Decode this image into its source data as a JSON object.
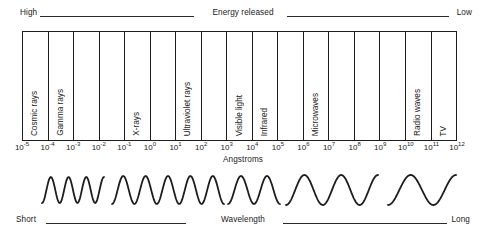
{
  "figure": {
    "unit_label": "Angstroms"
  },
  "energy_axis": {
    "caption": "Energy released",
    "left_label": "High",
    "right_label": "Low"
  },
  "wavelength_axis": {
    "caption": "Wavelength",
    "left_label": "Short",
    "right_label": "Long"
  },
  "chart_data": {
    "type": "table",
    "xlabel": "Angstroms",
    "ylabel": "",
    "grid": false,
    "legend": "none",
    "x_scale": "log10",
    "xlim": [
      -5,
      12
    ],
    "tick_labels": [
      "10-5",
      "10-4",
      "10-3",
      "10-2",
      "10-1",
      "100",
      "101",
      "102",
      "103",
      "104",
      "105",
      "106",
      "107",
      "108",
      "109",
      "1010",
      "1011",
      "1012"
    ],
    "tick_mantissa": "10",
    "tick_exponents": [
      "-5",
      "-4",
      "-3",
      "-2",
      "-1",
      "0",
      "1",
      "2",
      "3",
      "4",
      "5",
      "6",
      "7",
      "8",
      "9",
      "10",
      "11",
      "12"
    ],
    "cells": [
      {
        "label": "Cosmic rays",
        "from": "10-5",
        "to": "10-4"
      },
      {
        "label": "Gamma rays",
        "from": "10-4",
        "to": "10-3"
      },
      {
        "label": "",
        "from": "10-3",
        "to": "10-2"
      },
      {
        "label": "",
        "from": "10-2",
        "to": "10-1"
      },
      {
        "label": "X-rays",
        "from": "10-1",
        "to": "100"
      },
      {
        "label": "",
        "from": "100",
        "to": "101"
      },
      {
        "label": "Ultraviolet rays",
        "from": "101",
        "to": "102"
      },
      {
        "label": "",
        "from": "102",
        "to": "103"
      },
      {
        "label": "Visible light",
        "from": "103",
        "to": "104"
      },
      {
        "label": "Infrared",
        "from": "104",
        "to": "105"
      },
      {
        "label": "",
        "from": "105",
        "to": "106"
      },
      {
        "label": "Microwaves",
        "from": "106",
        "to": "107"
      },
      {
        "label": "",
        "from": "107",
        "to": "108"
      },
      {
        "label": "",
        "from": "108",
        "to": "109"
      },
      {
        "label": "",
        "from": "109",
        "to": "1010"
      },
      {
        "label": "Radio waves",
        "from": "1010",
        "to": "1011"
      },
      {
        "label": "TV",
        "from": "1011",
        "to": "1012"
      }
    ],
    "wave_segments": [
      {
        "start_px": 42,
        "end_px": 104,
        "cycles": 3.5,
        "amplitude_px": 13
      },
      {
        "start_px": 112,
        "end_px": 224,
        "cycles": 5,
        "amplitude_px": 14
      },
      {
        "start_px": 228,
        "end_px": 280,
        "cycles": 2,
        "amplitude_px": 14
      },
      {
        "start_px": 286,
        "end_px": 378,
        "cycles": 2.5,
        "amplitude_px": 15
      },
      {
        "start_px": 388,
        "end_px": 456,
        "cycles": 1.5,
        "amplitude_px": 15
      }
    ],
    "colors": {
      "ink": "#1d1d1d",
      "background": "#ffffff"
    }
  }
}
